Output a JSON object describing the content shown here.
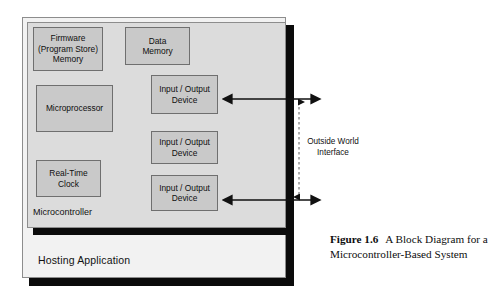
{
  "figure": {
    "number_label": "Figure 1.6",
    "caption_text": "A Block Diagram for a Microcontroller-Based System"
  },
  "diagram": {
    "outer_container": {
      "label": "Hosting Application"
    },
    "inner_container": {
      "label": "Microcontroller"
    },
    "blocks": [
      {
        "id": "firmware",
        "label": "Firmware\n(Program Store)\nMemory",
        "line1": "Firmware",
        "line2": "(Program Store)",
        "line3": "Memory"
      },
      {
        "id": "data-memory",
        "label": "Data Memory",
        "line1": "Data",
        "line2": "Memory",
        "line3": ""
      },
      {
        "id": "microprocessor",
        "label": "Microprocessor",
        "line1": "Microprocessor",
        "line2": "",
        "line3": ""
      },
      {
        "id": "real-time-clock",
        "label": "Real-Time Clock",
        "line1": "Real-Time",
        "line2": "Clock",
        "line3": ""
      },
      {
        "id": "io-device-1",
        "label": "Input / Output Device",
        "line1": "Input / Output",
        "line2": "Device",
        "line3": ""
      },
      {
        "id": "io-device-2",
        "label": "Input / Output Device",
        "line1": "Input / Output",
        "line2": "Device",
        "line3": ""
      },
      {
        "id": "io-device-3",
        "label": "Input / Output Device",
        "line1": "Input / Output",
        "line2": "Device",
        "line3": ""
      }
    ],
    "annotation": {
      "interface_line1": "Outside World",
      "interface_line2": "Interface"
    },
    "colors": {
      "page_background": "#ffffff",
      "hosting_fill": "#f2f2f2",
      "microcontroller_fill": "#dcdcdc",
      "block_fill": "#c9c9c9",
      "block_border": "#6f6f6f",
      "shadow": "#0b0b0b",
      "text": "#111111"
    }
  }
}
